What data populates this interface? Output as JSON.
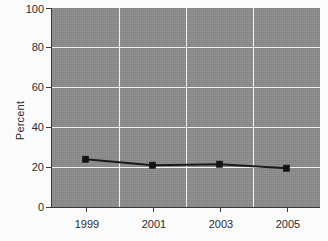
{
  "chart_data": {
    "type": "line",
    "title": "",
    "xlabel": "",
    "ylabel": "Percent",
    "x": [
      1999,
      2001,
      2003,
      2005
    ],
    "categories": [
      "1999",
      "2001",
      "2003",
      "2005"
    ],
    "values": [
      24,
      21,
      21.5,
      19.5
    ],
    "series": [
      {
        "name": "Percent",
        "values": [
          24,
          21,
          21.5,
          19.5
        ],
        "color": "#141414",
        "marker": "square"
      }
    ],
    "ylim": [
      0,
      100
    ],
    "yticks": [
      0,
      20,
      40,
      60,
      80,
      100
    ],
    "ytick_labels": [
      "0",
      "20",
      "40",
      "60",
      "80",
      "100"
    ],
    "xtick_labels": [
      "1999",
      "2001",
      "2003",
      "2005"
    ],
    "xlim": [
      1998,
      2006
    ],
    "grid": true,
    "grid_color": "#f2f2f2",
    "legend": false,
    "legend_position": "none",
    "plot_background": "#8c8c8c",
    "figure_background": "#fbfbfb",
    "axis_color": "#3a3a3a",
    "text_color": "#2b2b2b"
  },
  "axes": {
    "y_title": "Percent",
    "y_ticks": [
      {
        "label": "100",
        "value": 100
      },
      {
        "label": "80",
        "value": 80
      },
      {
        "label": "60",
        "value": 60
      },
      {
        "label": "40",
        "value": 40
      },
      {
        "label": "20",
        "value": 20
      },
      {
        "label": "0",
        "value": 0
      }
    ],
    "x_ticks": [
      {
        "label": "1999",
        "value": 1999
      },
      {
        "label": "2001",
        "value": 2001
      },
      {
        "label": "2003",
        "value": 2003
      },
      {
        "label": "2005",
        "value": 2005
      }
    ]
  }
}
